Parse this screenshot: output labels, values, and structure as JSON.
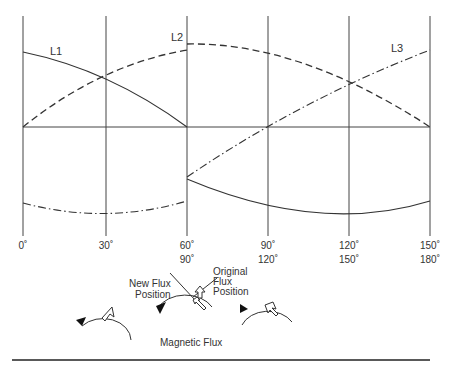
{
  "diagram": {
    "series_labels": {
      "l1": "L1",
      "l2": "L2",
      "l3": "L3"
    },
    "x_ticks_top": [
      "0˚",
      "30˚",
      "60˚",
      "90˚",
      "120˚",
      "150˚"
    ],
    "x_ticks_bottom": [
      "",
      "",
      "90˚",
      "120˚",
      "150˚",
      "180˚"
    ],
    "annotations": {
      "new_flux": [
        "New Flux",
        "Position"
      ],
      "original_flux": [
        "Original",
        "Flux",
        "Position"
      ]
    },
    "caption": "Magnetic Flux",
    "colors": {
      "line": "#333333",
      "background": "#ffffff"
    }
  }
}
